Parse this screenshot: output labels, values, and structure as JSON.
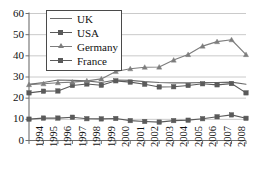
{
  "chart_data": {
    "type": "line",
    "title": "",
    "xlabel": "",
    "ylabel": "",
    "ylim": [
      0,
      60
    ],
    "yticks": [
      0,
      10,
      20,
      30,
      40,
      50,
      60
    ],
    "grid": true,
    "legend_position": "top-center",
    "categories": [
      "1994",
      "1995",
      "1996",
      "1997",
      "1998",
      "1999",
      "2000",
      "2001",
      "2002",
      "2003",
      "2004",
      "2005",
      "2006",
      "2007",
      "2008",
      "2009"
    ],
    "series": [
      {
        "name": "UK",
        "marker": "none",
        "color": "#6b6b6b",
        "values": [
          26.5,
          27.4,
          28.6,
          28.4,
          28.2,
          27.4,
          28.6,
          28.4,
          27.8,
          27.4,
          27.2,
          27.2,
          27.4,
          27.4,
          27.6,
          26.6
        ]
      },
      {
        "name": "USA",
        "marker": "square",
        "color": "#5a5a5a",
        "values": [
          22.5,
          23.3,
          23.4,
          26.0,
          26.7,
          26.1,
          28.2,
          27.6,
          26.6,
          25.3,
          25.4,
          26.0,
          26.8,
          26.3,
          26.9,
          22.5
        ]
      },
      {
        "name": "Germany",
        "marker": "triangle",
        "color": "#7d7d7d",
        "values": [
          26.4,
          26.8,
          27.3,
          27.6,
          28.2,
          29.1,
          32.6,
          33.9,
          34.6,
          34.7,
          38.0,
          40.6,
          44.6,
          46.7,
          47.6,
          40.6
        ]
      },
      {
        "name": "France",
        "marker": "square",
        "color": "#5a5a5a",
        "values": [
          10.1,
          10.6,
          10.6,
          11.0,
          10.3,
          10.2,
          10.4,
          9.4,
          9.0,
          8.7,
          9.4,
          9.6,
          10.3,
          11.2,
          12.1,
          10.5
        ]
      }
    ]
  },
  "legend": {
    "items": [
      {
        "label": "UK",
        "marker": "none"
      },
      {
        "label": "USA",
        "marker": "square"
      },
      {
        "label": "Germany",
        "marker": "triangle"
      },
      {
        "label": "France",
        "marker": "square"
      }
    ]
  }
}
